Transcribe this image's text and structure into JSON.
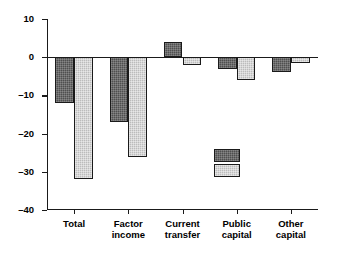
{
  "chart_data": {
    "type": "bar",
    "title": "",
    "subtitle": "",
    "xlabel": "",
    "ylabel": "",
    "categories": [
      "Total",
      "Factor\nincome",
      "Current\ntransfer",
      "Public\ncapital",
      "Other\ncapital"
    ],
    "series": [
      {
        "name": "1956",
        "color": "#4f4f4f",
        "values": [
          -12,
          -17,
          4,
          -3,
          -4
        ]
      },
      {
        "name": "1980",
        "color": "#bcbcbc",
        "values": [
          -32,
          -26,
          -2,
          -6,
          -1.5
        ]
      }
    ],
    "ylim": [
      -40,
      10
    ],
    "yticks": [
      10,
      0,
      -10,
      -20,
      -30,
      -40
    ],
    "ytick_labels": [
      "10",
      "0",
      "–10",
      "–20",
      "–30",
      "–40"
    ],
    "grid": false,
    "legend_position": "inside-lower-right",
    "legend_entries": [
      "1956",
      "1980"
    ]
  }
}
